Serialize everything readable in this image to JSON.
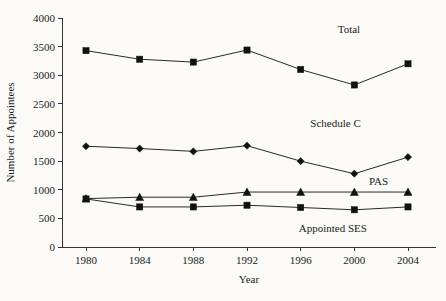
{
  "chart_data": {
    "type": "line",
    "title": "",
    "xlabel": "Year",
    "ylabel": "Number of Appointees",
    "x": [
      1980,
      1984,
      1988,
      1992,
      1996,
      2000,
      2004
    ],
    "xtick_labels": [
      "1980",
      "1984",
      "1988",
      "1992",
      "1996",
      "2000",
      "2004"
    ],
    "ylim": [
      0,
      4000
    ],
    "ytick_values": [
      0,
      500,
      1000,
      1500,
      2000,
      2500,
      3000,
      3500,
      4000
    ],
    "ytick_labels": [
      "0",
      "500",
      "1000",
      "1500",
      "2000",
      "2500",
      "3000",
      "3500",
      "4000"
    ],
    "grid": false,
    "legend_position": "inline-right",
    "series": [
      {
        "name": "Total",
        "marker": "square",
        "color": "#111111",
        "values": [
          3430,
          3280,
          3230,
          3440,
          3100,
          2830,
          3200
        ]
      },
      {
        "name": "Schedule C",
        "marker": "diamond",
        "color": "#111111",
        "values": [
          1760,
          1720,
          1670,
          1770,
          1500,
          1280,
          1570
        ]
      },
      {
        "name": "PAS",
        "marker": "triangle",
        "color": "#111111",
        "values": [
          845,
          870,
          870,
          960,
          960,
          960,
          960
        ]
      },
      {
        "name": "Appointed SES",
        "marker": "square",
        "color": "#111111",
        "values": [
          840,
          700,
          700,
          730,
          690,
          650,
          700
        ]
      }
    ],
    "annotations": [
      {
        "text": "Total",
        "x": 1999.6,
        "y": 3730
      },
      {
        "text": "Schedule C",
        "x": 1998.6,
        "y": 2100
      },
      {
        "text": "PAS",
        "x": 2001.8,
        "y": 1080
      },
      {
        "text": "Appointed SES",
        "x": 1998.4,
        "y": 260
      }
    ]
  }
}
